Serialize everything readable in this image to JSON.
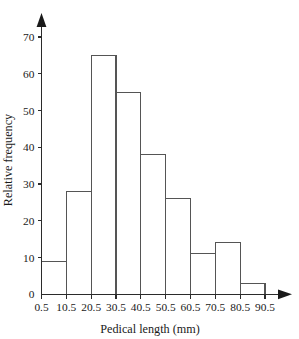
{
  "chart_data": {
    "type": "bar",
    "title": "",
    "subtitle": "",
    "xlabel": "Pedical length (mm)",
    "ylabel": "Relative frequency",
    "categories": [
      "0.5-10.5",
      "10.5-20.5",
      "20.5-30.5",
      "30.5-40.5",
      "40.5-50.5",
      "50.5-60.5",
      "60.5-70.5",
      "70.5-80.5",
      "80.5-90.5"
    ],
    "values": [
      9,
      28,
      65,
      55,
      38,
      26,
      11,
      14,
      3
    ],
    "bin_edges": [
      0.5,
      10.5,
      20.5,
      30.5,
      40.5,
      50.5,
      60.5,
      70.5,
      80.5,
      90.5
    ],
    "x_tick_labels": [
      "0.5",
      "10.5",
      "20.5",
      "30.5",
      "40.5",
      "50.5",
      "60.5",
      "70.5",
      "80.5",
      "90.5"
    ],
    "y_tick_labels": [
      "0",
      "10",
      "20",
      "30",
      "40",
      "50",
      "60",
      "70"
    ],
    "y_tick_values": [
      0,
      10,
      20,
      30,
      40,
      50,
      60,
      70
    ],
    "xlim": [
      0.5,
      90.5
    ],
    "ylim": [
      0,
      74
    ],
    "grid": false,
    "legend": "none",
    "bar_fill_color": "#ffffff",
    "bar_stroke_color": "#555555",
    "axis_color": "#2b2b2b",
    "background_color": "#ffffff",
    "x_axis_arrow": true,
    "y_axis_arrow": true
  }
}
